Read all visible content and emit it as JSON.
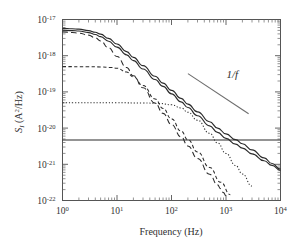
{
  "chart_data": {
    "type": "line",
    "title": "",
    "xlabel": "Frequency (Hz)",
    "ylabel": "S_I (A^2/Hz)",
    "ylabel_parts": {
      "main": "S",
      "sub": "I",
      "unit_open": " (A",
      "unit_sup": "2",
      "unit_close": "/Hz)"
    },
    "xscale": "log",
    "yscale": "log",
    "xlim": [
      1,
      10000
    ],
    "ylim": [
      1e-22,
      1e-17
    ],
    "grid": false,
    "legend": null,
    "xticks": [
      {
        "value": 1,
        "mantissa": "10",
        "exponent": "0"
      },
      {
        "value": 10,
        "mantissa": "10",
        "exponent": "1"
      },
      {
        "value": 100,
        "mantissa": "10",
        "exponent": "2"
      },
      {
        "value": 1000,
        "mantissa": "10",
        "exponent": "3"
      },
      {
        "value": 10000,
        "mantissa": "10",
        "exponent": "4"
      }
    ],
    "yticks": [
      {
        "value": 1e-17,
        "mantissa": "10",
        "exponent": "-17"
      },
      {
        "value": 1e-18,
        "mantissa": "10",
        "exponent": "-18"
      },
      {
        "value": 1e-19,
        "mantissa": "10",
        "exponent": "-19"
      },
      {
        "value": 1e-20,
        "mantissa": "10",
        "exponent": "-20"
      },
      {
        "value": 1e-21,
        "mantissa": "10",
        "exponent": "-21"
      },
      {
        "value": 1e-22,
        "mantissa": "10",
        "exponent": "-22"
      }
    ],
    "annotations": [
      {
        "name": "one-over-f-label",
        "text": "1/f",
        "x": 1300,
        "y": 2.4e-19,
        "guide_line": {
          "x1": 200,
          "y1": 3.2e-19,
          "x2": 2600,
          "y2": 2.5e-20,
          "slope": -1
        }
      }
    ],
    "series": [
      {
        "name": "lorentzian-long-dash",
        "style": "long-dash",
        "corner_frequency": 7,
        "plateau": 4.6e-18,
        "slope_high": -2,
        "points": [
          [
            1,
            4.55e-18
          ],
          [
            1.5,
            4.4e-18
          ],
          [
            2,
            4.2e-18
          ],
          [
            3,
            3.7e-18
          ],
          [
            4,
            3.1e-18
          ],
          [
            5,
            2.55e-18
          ],
          [
            7,
            1.65e-18
          ],
          [
            10,
            9.5e-19
          ],
          [
            15,
            4.7e-19
          ],
          [
            20,
            2.8e-19
          ],
          [
            30,
            1.3e-19
          ],
          [
            50,
            4.9e-20
          ],
          [
            70,
            2.55e-20
          ],
          [
            100,
            1.26e-20
          ],
          [
            150,
            5.7e-21
          ],
          [
            200,
            3.2e-21
          ],
          [
            300,
            1.45e-21
          ],
          [
            500,
            5.3e-22
          ],
          [
            700,
            2.7e-22
          ],
          [
            800,
            2.1e-22
          ],
          [
            900,
            1.65e-22
          ],
          [
            1000,
            1.35e-22
          ]
        ]
      },
      {
        "name": "lorentzian-medium-dash",
        "style": "dash",
        "corner_frequency": 11,
        "plateau": 5e-19,
        "slope_high": -2,
        "points": [
          [
            1,
            5e-19
          ],
          [
            3,
            4.95e-19
          ],
          [
            5,
            4.9e-19
          ],
          [
            8,
            4.7e-19
          ],
          [
            10,
            4.5e-19
          ],
          [
            15,
            3.55e-19
          ],
          [
            20,
            2.6e-19
          ],
          [
            30,
            1.5e-19
          ],
          [
            50,
            6.4e-20
          ],
          [
            70,
            3.5e-20
          ],
          [
            100,
            1.8e-20
          ],
          [
            150,
            8.3e-21
          ],
          [
            200,
            4.8e-21
          ],
          [
            300,
            2.2e-21
          ],
          [
            500,
            8.2e-22
          ],
          [
            800,
            3.2e-22
          ],
          [
            1200,
            1.45e-22
          ],
          [
            1600,
            8.3e-23
          ],
          [
            2000,
            5.4e-23
          ],
          [
            2400,
            3.8e-23
          ]
        ]
      },
      {
        "name": "lorentzian-dotted",
        "style": "dot",
        "corner_frequency": 120,
        "plateau": 5e-20,
        "slope_high": -2,
        "points": [
          [
            1,
            5e-20
          ],
          [
            10,
            5e-20
          ],
          [
            30,
            4.95e-20
          ],
          [
            60,
            4.8e-20
          ],
          [
            100,
            4.4e-20
          ],
          [
            150,
            3.6e-20
          ],
          [
            200,
            2.75e-20
          ],
          [
            300,
            1.65e-20
          ],
          [
            500,
            7.2e-21
          ],
          [
            700,
            3.9e-21
          ],
          [
            1000,
            2e-21
          ],
          [
            1500,
            9.3e-22
          ],
          [
            2000,
            5.4e-22
          ],
          [
            3000,
            2.5e-22
          ],
          [
            5000,
            9.2e-23
          ],
          [
            7000,
            4.8e-23
          ],
          [
            10000,
            2.4e-23
          ]
        ]
      },
      {
        "name": "white-noise-floor",
        "style": "solid",
        "plateau": 4.7e-21,
        "slope_high": 0,
        "points": [
          [
            1,
            4.7e-21
          ],
          [
            10000,
            4.7e-21
          ]
        ]
      },
      {
        "name": "sum-upper-solid",
        "style": "solid",
        "points": [
          [
            1,
            5.7e-18
          ],
          [
            1.5,
            5.55e-18
          ],
          [
            2,
            5.4e-18
          ],
          [
            3,
            4.95e-18
          ],
          [
            4,
            4.45e-18
          ],
          [
            5,
            3.95e-18
          ],
          [
            7,
            3e-18
          ],
          [
            10,
            2.1e-18
          ],
          [
            15,
            1.3e-18
          ],
          [
            20,
            9e-19
          ],
          [
            30,
            5.3e-19
          ],
          [
            50,
            2.7e-19
          ],
          [
            70,
            1.75e-19
          ],
          [
            100,
            1.1e-19
          ],
          [
            150,
            6.6e-20
          ],
          [
            200,
            4.6e-20
          ],
          [
            300,
            2.8e-20
          ],
          [
            500,
            1.5e-20
          ],
          [
            700,
            1e-20
          ],
          [
            1000,
            6.9e-21
          ],
          [
            1500,
            4.8e-21
          ],
          [
            2000,
            3.7e-21
          ],
          [
            3000,
            2.5e-21
          ],
          [
            5000,
            1.5e-21
          ],
          [
            7000,
            1.05e-21
          ],
          [
            10000,
            7.4e-22
          ]
        ]
      },
      {
        "name": "sum-lower-solid",
        "style": "solid",
        "points": [
          [
            1,
            5.1e-18
          ],
          [
            1.5,
            4.95e-18
          ],
          [
            2,
            4.8e-18
          ],
          [
            3,
            4.35e-18
          ],
          [
            4,
            3.85e-18
          ],
          [
            5,
            3.35e-18
          ],
          [
            7,
            2.5e-18
          ],
          [
            10,
            1.72e-18
          ],
          [
            15,
            1.05e-18
          ],
          [
            20,
            7.3e-19
          ],
          [
            30,
            4.3e-19
          ],
          [
            50,
            2.2e-19
          ],
          [
            70,
            1.42e-19
          ],
          [
            100,
            8.8e-20
          ],
          [
            150,
            5.3e-20
          ],
          [
            200,
            3.7e-20
          ],
          [
            300,
            2.2e-20
          ],
          [
            500,
            1.15e-20
          ],
          [
            700,
            7.6e-21
          ],
          [
            1000,
            5.2e-21
          ],
          [
            1500,
            3.6e-21
          ],
          [
            2000,
            2.8e-21
          ],
          [
            3000,
            1.95e-21
          ],
          [
            5000,
            1.25e-21
          ],
          [
            7000,
            9.3e-22
          ],
          [
            10000,
            6.8e-22
          ]
        ]
      }
    ]
  },
  "figure": {
    "colors": {
      "curve": "#2b2b2b",
      "axis": "#555555",
      "guide": "#6d6d6d",
      "background": "#ffffff"
    }
  }
}
